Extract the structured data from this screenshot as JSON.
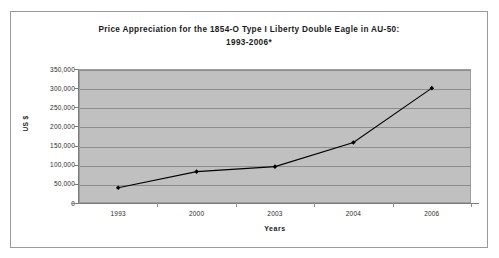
{
  "chart_data": {
    "type": "line",
    "title": "Price Appreciation for the 1854-O Type I Liberty Double Eagle in AU-50:",
    "title_line2": "1993-2006*",
    "xlabel": "Years",
    "ylabel": "US $",
    "categories": [
      "1993",
      "2000",
      "2003",
      "2004",
      "2006"
    ],
    "values": [
      40000,
      82000,
      95000,
      158000,
      300000
    ],
    "series": [
      {
        "name": "Price",
        "values": [
          40000,
          82000,
          95000,
          158000,
          300000
        ]
      }
    ],
    "ylim": [
      0,
      350000
    ],
    "ytick_step": 50000,
    "ytick_labels": [
      "350,000",
      "300,000",
      "250,000",
      "200,000",
      "150,000",
      "100,000",
      "50,000",
      "0"
    ],
    "ytick_values": [
      350000,
      300000,
      250000,
      200000,
      150000,
      100000,
      50000,
      0
    ],
    "grid": "horizontal",
    "legend": "none",
    "marker": "filled-diamond",
    "line_color": "#000000",
    "marker_color": "#000000",
    "plot_background": "#c0c0c0",
    "gridline_color": "#8d8d8d",
    "chart_background": "#ffffff",
    "border_color": "#9a9a9a"
  }
}
